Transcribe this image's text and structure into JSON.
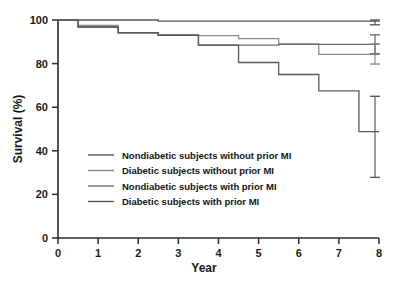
{
  "chart_data": {
    "type": "line",
    "title": "",
    "xlabel": "Year",
    "ylabel": "Survival (%)",
    "xlim": [
      0,
      8
    ],
    "ylim": [
      0,
      100
    ],
    "xticks": [
      "0",
      "1",
      "2",
      "3",
      "4",
      "5",
      "6",
      "7",
      "8"
    ],
    "yticks": [
      "0",
      "20",
      "40",
      "60",
      "80",
      "100"
    ],
    "grid": false,
    "legend_position": "center-left",
    "step_style": "post",
    "series": [
      {
        "name": "Nondiabetic subjects without prior MI",
        "color": "#555555",
        "points": [
          {
            "x": 0,
            "y": 100
          },
          {
            "x": 0.5,
            "y": 100
          },
          {
            "x": 2.5,
            "y": 99.5
          },
          {
            "x": 7.5,
            "y": 99.5
          },
          {
            "x": 8,
            "y": 99.2
          }
        ],
        "error_bar": {
          "x": 8,
          "y": 99.2,
          "low": 97.8,
          "high": 100.4
        }
      },
      {
        "name": "Diabetic subjects without prior MI",
        "color": "#8c8c8c",
        "points": [
          {
            "x": 0,
            "y": 100
          },
          {
            "x": 0.5,
            "y": 97.5
          },
          {
            "x": 1.5,
            "y": 94.0
          },
          {
            "x": 2.5,
            "y": 93.0
          },
          {
            "x": 3.5,
            "y": 92.8
          },
          {
            "x": 4.5,
            "y": 91.5
          },
          {
            "x": 5.5,
            "y": 89.0
          },
          {
            "x": 6.5,
            "y": 84.2
          },
          {
            "x": 8,
            "y": 84.2
          }
        ],
        "error_bar": {
          "x": 8,
          "y": 84.2,
          "low": 79.8,
          "high": 89.0
        }
      },
      {
        "name": "Nondiabetic subjects with prior MI",
        "color": "#6b6b6b",
        "points": [
          {
            "x": 0,
            "y": 100
          },
          {
            "x": 0.5,
            "y": 96.8
          },
          {
            "x": 1.5,
            "y": 94.2
          },
          {
            "x": 2.5,
            "y": 93.0
          },
          {
            "x": 3.5,
            "y": 88.5
          },
          {
            "x": 4.5,
            "y": 88.5
          },
          {
            "x": 5.5,
            "y": 88.8
          },
          {
            "x": 6.5,
            "y": 88.8
          },
          {
            "x": 8,
            "y": 88.8
          }
        ],
        "error_bar": {
          "x": 8,
          "y": 88.8,
          "low": 84.5,
          "high": 93.2
        }
      },
      {
        "name": "Diabetic subjects with prior MI",
        "color": "#5a5a5a",
        "points": [
          {
            "x": 0,
            "y": 100
          },
          {
            "x": 0.5,
            "y": 96.8
          },
          {
            "x": 1.5,
            "y": 94.2
          },
          {
            "x": 2.5,
            "y": 93.0
          },
          {
            "x": 3.5,
            "y": 88.5
          },
          {
            "x": 4.5,
            "y": 80.5
          },
          {
            "x": 5.5,
            "y": 75.0
          },
          {
            "x": 6.5,
            "y": 67.5
          },
          {
            "x": 7.5,
            "y": 48.8
          },
          {
            "x": 8,
            "y": 48.8
          }
        ],
        "error_bar": {
          "x": 8,
          "y": 48.8,
          "low": 27.8,
          "high": 65.0
        }
      }
    ]
  },
  "legend": {
    "items": [
      {
        "label": "Nondiabetic subjects without prior MI"
      },
      {
        "label": "Diabetic subjects without prior MI"
      },
      {
        "label": "Nondiabetic subjects with prior MI"
      },
      {
        "label": "Diabetic subjects with prior MI"
      }
    ]
  }
}
